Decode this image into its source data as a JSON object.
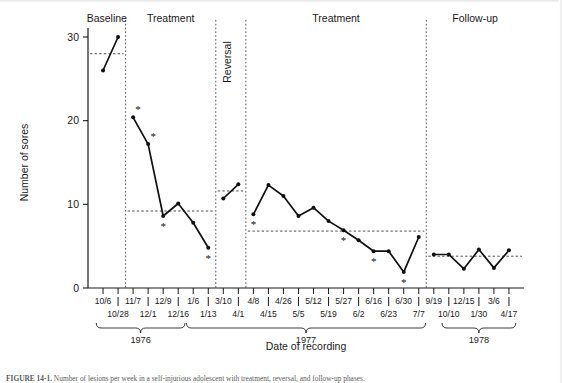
{
  "figure": {
    "caption_prefix": "FIGURE 14-1.",
    "caption_text": " Number of lesions per week in a self-injurious adolescent with treatment, reversal, and follow-up phases."
  },
  "axes": {
    "y_title": "Number of sores",
    "x_title": "Date of recording",
    "y_ticks": [
      0,
      10,
      20,
      30
    ],
    "y_min": 0,
    "y_max": 31.5
  },
  "phases": [
    {
      "name": "Baseline",
      "label": "Baseline",
      "rotated": false,
      "mean": 28.0
    },
    {
      "name": "Treatment",
      "label": "Treatment",
      "rotated": false,
      "mean": 9.2
    },
    {
      "name": "Reversal",
      "label": "Reversal",
      "rotated": true,
      "mean": 11.6
    },
    {
      "name": "Treatment",
      "label": "Treatment",
      "rotated": false,
      "mean": 6.8
    },
    {
      "name": "Follow-up",
      "label": "Follow-up",
      "rotated": false,
      "mean": 3.8
    }
  ],
  "years": [
    {
      "label": "1976"
    },
    {
      "label": "1977"
    },
    {
      "label": "1978"
    }
  ],
  "tick_labels_row1": [
    "10/6",
    "11/7",
    "12/9",
    "1/6",
    "3/10",
    "4/8",
    "4/26",
    "5/12",
    "5/27",
    "6/16",
    "6/30",
    "9/19",
    "12/15",
    "3/6"
  ],
  "tick_labels_row2": [
    "10/28",
    "12/1",
    "12/16",
    "1/13",
    "4/1",
    "4/15",
    "5/5",
    "5/19",
    "6/2",
    "6/23",
    "7/7",
    "10/10",
    "1/30",
    "4/17"
  ],
  "chart_data": {
    "type": "line",
    "title": "",
    "xlabel": "Date of recording",
    "ylabel": "Number of sores",
    "ylim": [
      0,
      31.5
    ],
    "grid": false,
    "legend": "none",
    "annotation_symbol": "*",
    "x": [
      "10/6",
      "10/28",
      "11/7",
      "12/1",
      "12/9",
      "12/16",
      "1/6",
      "1/13",
      "3/10",
      "4/1",
      "4/8",
      "4/15",
      "4/26",
      "5/5",
      "5/12",
      "5/19",
      "5/27",
      "6/2",
      "6/16",
      "6/23",
      "6/30",
      "7/7",
      "9/19",
      "10/10",
      "12/15",
      "1/30",
      "3/6",
      "4/17"
    ],
    "segments": [
      {
        "phase": "Baseline",
        "mean": 28.0,
        "points": [
          {
            "x": "10/6",
            "y": 26.0,
            "star": false
          },
          {
            "x": "10/28",
            "y": 30.0,
            "star": false
          }
        ]
      },
      {
        "phase": "Treatment",
        "mean": 9.2,
        "points": [
          {
            "x": "11/7",
            "y": 20.4,
            "star": true
          },
          {
            "x": "12/1",
            "y": 17.2,
            "star": true
          },
          {
            "x": "12/9",
            "y": 8.6,
            "star": true
          },
          {
            "x": "12/16",
            "y": 10.1,
            "star": false
          },
          {
            "x": "1/6",
            "y": 7.8,
            "star": false
          },
          {
            "x": "1/13",
            "y": 4.8,
            "star": true
          }
        ]
      },
      {
        "phase": "Reversal",
        "mean": 11.6,
        "points": [
          {
            "x": "3/10",
            "y": 10.7,
            "star": false
          },
          {
            "x": "4/1",
            "y": 12.4,
            "star": false
          }
        ]
      },
      {
        "phase": "Treatment",
        "mean": 6.8,
        "points": [
          {
            "x": "4/8",
            "y": 8.8,
            "star": true
          },
          {
            "x": "4/15",
            "y": 12.3,
            "star": false
          },
          {
            "x": "4/26",
            "y": 11.0,
            "star": false
          },
          {
            "x": "5/5",
            "y": 8.6,
            "star": false
          },
          {
            "x": "5/12",
            "y": 9.6,
            "star": false
          },
          {
            "x": "5/19",
            "y": 8.0,
            "star": false
          },
          {
            "x": "5/27",
            "y": 6.9,
            "star": true
          },
          {
            "x": "6/2",
            "y": 5.7,
            "star": false
          },
          {
            "x": "6/16",
            "y": 4.4,
            "star": true
          },
          {
            "x": "6/23",
            "y": 4.4,
            "star": false
          },
          {
            "x": "6/30",
            "y": 1.9,
            "star": true
          },
          {
            "x": "7/7",
            "y": 6.1,
            "star": false
          }
        ]
      },
      {
        "phase": "Follow-up",
        "mean": 3.8,
        "points": [
          {
            "x": "9/19",
            "y": 4.0,
            "star": false
          },
          {
            "x": "10/10",
            "y": 4.0,
            "star": false
          },
          {
            "x": "12/15",
            "y": 2.3,
            "star": false
          },
          {
            "x": "1/30",
            "y": 4.6,
            "star": false
          },
          {
            "x": "3/6",
            "y": 2.4,
            "star": false
          },
          {
            "x": "4/17",
            "y": 4.5,
            "star": false
          }
        ]
      }
    ]
  }
}
